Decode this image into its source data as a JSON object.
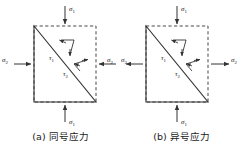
{
  "figure": {
    "title": "",
    "background_color": "#ffffff",
    "line_color": "#333333",
    "panels": [
      {
        "id": "panel-a",
        "caption_index": "(a)",
        "caption_text": "同号应力",
        "caption_full": "(a) 同号应力",
        "sigma1_top_label": "σ",
        "sigma1_top_sub": "1",
        "sigma1_top_direction": "down",
        "sigma1_bottom_label": "σ",
        "sigma1_bottom_sub": "1",
        "sigma1_bottom_direction": "up",
        "sigma2_left_label": "σ",
        "sigma2_left_sub": "2",
        "sigma2_left_direction": "right",
        "sigma2_right_label": "σ",
        "sigma2_right_sub": "2",
        "sigma2_right_direction": "left",
        "tau1_label": "τ",
        "tau1_sub": "1",
        "tau2_label": "τ",
        "tau2_sub": "2"
      },
      {
        "id": "panel-b",
        "caption_index": "(b)",
        "caption_text": "异号应力",
        "caption_full": "(b) 异号应力",
        "sigma1_top_label": "σ",
        "sigma1_top_sub": "1",
        "sigma1_top_direction": "down",
        "sigma1_bottom_label": "σ",
        "sigma1_bottom_sub": "1",
        "sigma1_bottom_direction": "up",
        "sigma2_left_label": "σ",
        "sigma2_left_sub": "2",
        "sigma2_left_direction": "left",
        "sigma2_right_label": "σ",
        "sigma2_right_sub": "2",
        "sigma2_right_direction": "right",
        "tau1_label": "τ",
        "tau1_sub": "1",
        "tau2_label": "τ",
        "tau2_sub": "2"
      }
    ]
  }
}
